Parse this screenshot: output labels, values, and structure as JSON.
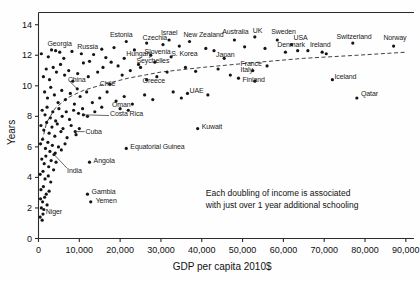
{
  "chart_data": {
    "type": "scatter",
    "title": "",
    "subtitle": "",
    "xlabel": "GDP per capita 2010$",
    "ylabel": "Years",
    "xlim": [
      0,
      92000
    ],
    "ylim": [
      0,
      14.8
    ],
    "grid": false,
    "legend": null,
    "xticks": [
      "0",
      "10,000",
      "20,000",
      "30,000",
      "40,000",
      "50,000",
      "60,000",
      "70,000",
      "80,000",
      "90,000"
    ],
    "xtick_values": [
      0,
      10000,
      20000,
      30000,
      40000,
      50000,
      60000,
      70000,
      80000,
      90000
    ],
    "yticks": [
      "0",
      "2",
      "4",
      "6",
      "8",
      "10",
      "12",
      "14"
    ],
    "ytick_values": [
      0,
      2,
      4,
      6,
      8,
      10,
      12,
      14
    ],
    "annotations": [
      {
        "name": "trend-annotation",
        "line1": "Each doubling of income is associated",
        "line2": "with just over 1 year additional schooling",
        "x": 46000,
        "y": 3.3
      }
    ],
    "trendline": {
      "style": "dashed",
      "description": "logarithmic fit of schooling years on GDP per capita",
      "points": [
        [
          900,
          6.4
        ],
        [
          2000,
          7.6
        ],
        [
          4000,
          8.5
        ],
        [
          7000,
          9.2
        ],
        [
          11000,
          9.7
        ],
        [
          16000,
          10.1
        ],
        [
          22000,
          10.5
        ],
        [
          30000,
          10.9
        ],
        [
          40000,
          11.2
        ],
        [
          52000,
          11.5
        ],
        [
          65000,
          11.8
        ],
        [
          78000,
          12.0
        ],
        [
          90000,
          12.2
        ]
      ]
    },
    "labeled_points": [
      {
        "label": "Georgia",
        "x": 4200,
        "y": 12.3,
        "lx": 2200,
        "ly": 12.75,
        "anchor": "start"
      },
      {
        "label": "Russia",
        "x": 15500,
        "y": 12.4,
        "lx": 9500,
        "ly": 12.55,
        "anchor": "start"
      },
      {
        "label": "Estonia",
        "x": 21500,
        "y": 12.9,
        "lx": 17500,
        "ly": 13.35,
        "anchor": "start"
      },
      {
        "label": "Czechia",
        "x": 26500,
        "y": 12.8,
        "lx": 25500,
        "ly": 13.15,
        "anchor": "start"
      },
      {
        "label": "Israel",
        "x": 32000,
        "y": 13.0,
        "lx": 30000,
        "ly": 13.45,
        "anchor": "start"
      },
      {
        "label": "New Zealand",
        "x": 37000,
        "y": 12.9,
        "lx": 35500,
        "ly": 13.3,
        "anchor": "start"
      },
      {
        "label": "Australia",
        "x": 48000,
        "y": 13.0,
        "lx": 45000,
        "ly": 13.5,
        "anchor": "start"
      },
      {
        "label": "UK",
        "x": 53000,
        "y": 13.2,
        "lx": 52500,
        "ly": 13.6,
        "anchor": "start"
      },
      {
        "label": "Sweden",
        "x": 58500,
        "y": 13.0,
        "lx": 57000,
        "ly": 13.55,
        "anchor": "start"
      },
      {
        "label": "USA",
        "x": 62000,
        "y": 12.7,
        "lx": 62500,
        "ly": 13.1,
        "anchor": "start"
      },
      {
        "label": "Denmark",
        "x": 63500,
        "y": 12.3,
        "lx": 58500,
        "ly": 12.65,
        "anchor": "start"
      },
      {
        "label": "Ireland",
        "x": 69500,
        "y": 12.2,
        "lx": 66500,
        "ly": 12.65,
        "anchor": "start"
      },
      {
        "label": "Switzerland",
        "x": 77000,
        "y": 12.8,
        "lx": 73000,
        "ly": 13.2,
        "anchor": "start"
      },
      {
        "label": "Norway",
        "x": 87000,
        "y": 12.6,
        "lx": 84500,
        "ly": 13.1,
        "anchor": "start"
      },
      {
        "label": "Hungary",
        "x": 21000,
        "y": 11.8,
        "lx": 21500,
        "ly": 12.05,
        "anchor": "start"
      },
      {
        "label": "Slovenia",
        "x": 27500,
        "y": 12.0,
        "lx": 26000,
        "ly": 12.2,
        "anchor": "start"
      },
      {
        "label": "S. Korea",
        "x": 32500,
        "y": 11.9,
        "lx": 32500,
        "ly": 12.1,
        "anchor": "start"
      },
      {
        "label": "Japan",
        "x": 45500,
        "y": 11.8,
        "lx": 43500,
        "ly": 12.0,
        "anchor": "start"
      },
      {
        "label": "Seychelles",
        "x": 24500,
        "y": 11.4,
        "lx": 24000,
        "ly": 11.6,
        "anchor": "start"
      },
      {
        "label": "Italy",
        "x": 49000,
        "y": 10.5,
        "lx": 49500,
        "ly": 11.05,
        "anchor": "start"
      },
      {
        "label": "France",
        "x": 52500,
        "y": 11.0,
        "lx": 49500,
        "ly": 11.45,
        "anchor": "start"
      },
      {
        "label": "Finland",
        "x": 53000,
        "y": 10.3,
        "lx": 50000,
        "ly": 10.35,
        "anchor": "start"
      },
      {
        "label": "Iceland",
        "x": 72000,
        "y": 10.4,
        "lx": 72500,
        "ly": 10.6,
        "anchor": "start"
      },
      {
        "label": "Qatar",
        "x": 78000,
        "y": 9.2,
        "lx": 79000,
        "ly": 9.45,
        "anchor": "start"
      },
      {
        "label": "China",
        "x": 9500,
        "y": 9.8,
        "lx": 7200,
        "ly": 10.4,
        "anchor": "start"
      },
      {
        "label": "Chile",
        "x": 17500,
        "y": 10.1,
        "lx": 15000,
        "ly": 10.15,
        "anchor": "start"
      },
      {
        "label": "Greece",
        "x": 26500,
        "y": 10.4,
        "lx": 25500,
        "ly": 10.3,
        "anchor": "start"
      },
      {
        "label": "UAE",
        "x": 36500,
        "y": 9.5,
        "lx": 37000,
        "ly": 9.65,
        "anchor": "start"
      },
      {
        "label": "Oman",
        "x": 20000,
        "y": 8.5,
        "lx": 18000,
        "ly": 8.75,
        "anchor": "start"
      },
      {
        "label": "Costa Rica",
        "x": 11000,
        "y": 8.1,
        "lx": 17500,
        "ly": 8.15,
        "anchor": "start"
      },
      {
        "label": "Cuba",
        "x": 9000,
        "y": 7.0,
        "lx": 11500,
        "ly": 6.95,
        "anchor": "start"
      },
      {
        "label": "Kuwait",
        "x": 39000,
        "y": 7.2,
        "lx": 40000,
        "ly": 7.3,
        "anchor": "start"
      },
      {
        "label": "Equatorial Guinea",
        "x": 21500,
        "y": 5.9,
        "lx": 22500,
        "ly": 6.0,
        "anchor": "start"
      },
      {
        "label": "Angola",
        "x": 12500,
        "y": 5.0,
        "lx": 13500,
        "ly": 5.1,
        "anchor": "start"
      },
      {
        "label": "India",
        "x": 3800,
        "y": 5.5,
        "lx": 7000,
        "ly": 4.45,
        "anchor": "start"
      },
      {
        "label": "Gambia",
        "x": 12000,
        "y": 2.9,
        "lx": 13000,
        "ly": 3.05,
        "anchor": "start"
      },
      {
        "label": "Yemen",
        "x": 12800,
        "y": 2.4,
        "lx": 14000,
        "ly": 2.45,
        "anchor": "start"
      },
      {
        "label": "Niger",
        "x": 1100,
        "y": 1.6,
        "lx": 1800,
        "ly": 1.75,
        "anchor": "start"
      }
    ],
    "unlabeled_points": [
      [
        700,
        12.1
      ],
      [
        2400,
        11.9
      ],
      [
        3200,
        12.35
      ],
      [
        5200,
        12.2
      ],
      [
        6200,
        11.8
      ],
      [
        8200,
        12.25
      ],
      [
        10500,
        12.1
      ],
      [
        12500,
        11.6
      ],
      [
        13500,
        12.05
      ],
      [
        16500,
        11.85
      ],
      [
        18500,
        12.5
      ],
      [
        19500,
        11.3
      ],
      [
        23500,
        12.35
      ],
      [
        28500,
        11.55
      ],
      [
        30500,
        12.7
      ],
      [
        34500,
        12.6
      ],
      [
        41000,
        12.45
      ],
      [
        43000,
        12.3
      ],
      [
        50500,
        12.55
      ],
      [
        55500,
        12.45
      ],
      [
        60500,
        12.2
      ],
      [
        66000,
        12.3
      ],
      [
        70500,
        12.1
      ],
      [
        1200,
        10.6
      ],
      [
        1900,
        11.1
      ],
      [
        2700,
        10.4
      ],
      [
        3600,
        11.2
      ],
      [
        4400,
        10.9
      ],
      [
        5400,
        11.4
      ],
      [
        6400,
        10.7
      ],
      [
        7400,
        11.0
      ],
      [
        8400,
        10.3
      ],
      [
        9600,
        10.8
      ],
      [
        11000,
        11.5
      ],
      [
        12200,
        10.6
      ],
      [
        14500,
        10.9
      ],
      [
        15800,
        11.2
      ],
      [
        17800,
        11.55
      ],
      [
        20500,
        10.7
      ],
      [
        22500,
        11.0
      ],
      [
        25000,
        11.2
      ],
      [
        29000,
        10.6
      ],
      [
        31500,
        10.9
      ],
      [
        36000,
        11.2
      ],
      [
        38500,
        10.95
      ],
      [
        44000,
        11.1
      ],
      [
        47000,
        10.7
      ],
      [
        56000,
        11.3
      ],
      [
        1500,
        9.6
      ],
      [
        2200,
        9.2
      ],
      [
        3000,
        9.9
      ],
      [
        3900,
        9.4
      ],
      [
        4800,
        8.9
      ],
      [
        5700,
        9.7
      ],
      [
        6600,
        9.1
      ],
      [
        7800,
        9.5
      ],
      [
        8800,
        8.8
      ],
      [
        10200,
        9.3
      ],
      [
        11800,
        9.6
      ],
      [
        13200,
        8.9
      ],
      [
        15000,
        9.2
      ],
      [
        16800,
        9.6
      ],
      [
        19000,
        9.0
      ],
      [
        21000,
        9.3
      ],
      [
        23000,
        8.8
      ],
      [
        26000,
        9.4
      ],
      [
        28000,
        9.1
      ],
      [
        33000,
        9.6
      ],
      [
        35000,
        9.2
      ],
      [
        41500,
        9.4
      ],
      [
        900,
        8.4
      ],
      [
        1600,
        8.1
      ],
      [
        2100,
        8.6
      ],
      [
        2900,
        7.9
      ],
      [
        3500,
        8.3
      ],
      [
        4200,
        7.7
      ],
      [
        5000,
        8.5
      ],
      [
        5800,
        8.0
      ],
      [
        6800,
        8.3
      ],
      [
        7600,
        7.8
      ],
      [
        8600,
        8.4
      ],
      [
        9800,
        8.2
      ],
      [
        10800,
        8.5
      ],
      [
        12000,
        8.0
      ],
      [
        13800,
        8.3
      ],
      [
        15500,
        8.6
      ],
      [
        22000,
        8.4
      ],
      [
        600,
        7.4
      ],
      [
        1300,
        7.1
      ],
      [
        2000,
        7.6
      ],
      [
        2600,
        6.9
      ],
      [
        3300,
        7.3
      ],
      [
        4000,
        6.7
      ],
      [
        4600,
        7.5
      ],
      [
        5500,
        7.0
      ],
      [
        6000,
        7.2
      ],
      [
        7000,
        6.6
      ],
      [
        8000,
        7.4
      ],
      [
        9200,
        6.8
      ],
      [
        10000,
        7.2
      ],
      [
        500,
        6.2
      ],
      [
        1000,
        6.5
      ],
      [
        1700,
        5.9
      ],
      [
        2300,
        6.3
      ],
      [
        2800,
        5.7
      ],
      [
        3400,
        6.1
      ],
      [
        4100,
        5.6
      ],
      [
        4900,
        6.0
      ],
      [
        5600,
        5.8
      ],
      [
        6500,
        6.2
      ],
      [
        800,
        5.2
      ],
      [
        1400,
        4.9
      ],
      [
        1800,
        5.4
      ],
      [
        2500,
        4.7
      ],
      [
        3100,
        5.1
      ],
      [
        3700,
        4.5
      ],
      [
        4300,
        5.0
      ],
      [
        400,
        4.2
      ],
      [
        1100,
        4.4
      ],
      [
        1600,
        3.9
      ],
      [
        2400,
        4.1
      ],
      [
        3000,
        3.7
      ],
      [
        600,
        3.2
      ],
      [
        1200,
        3.4
      ],
      [
        1900,
        2.9
      ],
      [
        2600,
        3.1
      ],
      [
        500,
        2.6
      ],
      [
        1000,
        2.4
      ],
      [
        1500,
        2.7
      ],
      [
        2100,
        2.2
      ],
      [
        700,
        2.0
      ],
      [
        1300,
        1.9
      ],
      [
        400,
        1.4
      ],
      [
        900,
        1.2
      ]
    ]
  },
  "axes": {
    "y_title": "Years",
    "x_title": "GDP per capita 2010$"
  }
}
